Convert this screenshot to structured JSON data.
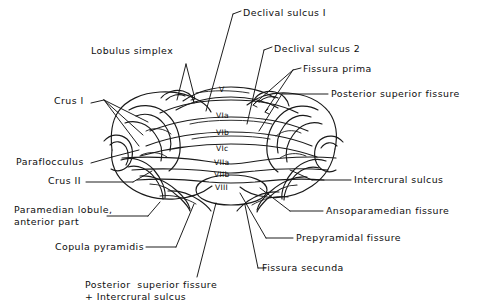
{
  "figure": {
    "ink_color": "#1a1a1a",
    "background_color": "#ffffff"
  },
  "labels": {
    "lobulus_simplex": "Lobulus simplex",
    "crus_i": "Crus I",
    "paraflocculus": "Paraflocculus",
    "crus_ii": "Crus II",
    "paramedian_lobule": "Paramedian lobule,\nanterior part",
    "copula_pyramidis": "Copula pyramidis",
    "posterior_superior_fissure_intercrural": "Posterior  superior fissure\n+ Intercrural sulcus",
    "declival_sulcus_1": "Declival sulcus I",
    "declival_sulcus_2": "Declival sulcus 2",
    "fissura_prima": "Fissura prima",
    "posterior_superior_fissure": "Posterior superior fissure",
    "intercrural_sulcus": "Intercrural sulcus",
    "ansoparamedian_fissure": "Ansoparamedian fissure",
    "prepyramidal_fissure": "Prepyramidal  fissure",
    "fissura_secunda": "Fissura secunda"
  },
  "lobules": [
    {
      "id": "lobule-v",
      "label": "V",
      "x": 224,
      "y": 91
    },
    {
      "id": "lobule-via",
      "label": "VIa",
      "x": 222,
      "y": 117
    },
    {
      "id": "lobule-vib",
      "label": "VIb",
      "x": 222,
      "y": 134
    },
    {
      "id": "lobule-vic",
      "label": "VIc",
      "x": 222,
      "y": 150
    },
    {
      "id": "lobule-viia",
      "label": "VIIa",
      "x": 221,
      "y": 164
    },
    {
      "id": "lobule-viib",
      "label": "VIIb",
      "x": 221,
      "y": 176
    },
    {
      "id": "lobule-viii",
      "label": "VIII",
      "x": 222,
      "y": 189
    }
  ]
}
